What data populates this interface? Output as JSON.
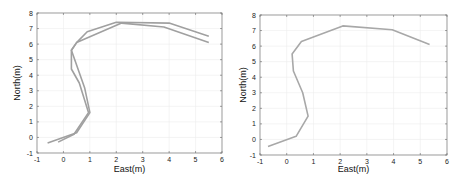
{
  "chart_data": [
    {
      "type": "line",
      "title": "",
      "xlabel": "East(m)",
      "ylabel": "North(m)",
      "xlim": [
        -1,
        6
      ],
      "ylim": [
        -1,
        8
      ],
      "xticks": [
        "-1",
        "0",
        "1",
        "2",
        "3",
        "4",
        "5",
        "6"
      ],
      "yticks": [
        "-1",
        "0",
        "1",
        "2",
        "3",
        "4",
        "5",
        "6",
        "7",
        "8"
      ],
      "grid": true,
      "legend": null,
      "series": [
        {
          "name": "trajectory-1",
          "color": "#a0a0a0",
          "x": [
            -0.6,
            0.5,
            1.0,
            0.8,
            0.3,
            0.5,
            0.9,
            2.0,
            4.0,
            5.5
          ],
          "y": [
            -0.35,
            0.3,
            1.6,
            3.2,
            5.6,
            6.1,
            6.8,
            7.4,
            7.35,
            6.5
          ]
        },
        {
          "name": "trajectory-2",
          "color": "#a0a0a0",
          "x": [
            -0.2,
            0.4,
            0.95,
            0.6,
            0.3,
            0.3,
            0.5,
            2.2,
            3.8,
            5.5
          ],
          "y": [
            -0.3,
            0.2,
            1.6,
            3.5,
            4.4,
            5.6,
            6.1,
            7.35,
            7.1,
            6.1
          ]
        }
      ]
    },
    {
      "type": "line",
      "title": "",
      "xlabel": "East(m)",
      "ylabel": "North(m)",
      "xlim": [
        -1,
        6
      ],
      "ylim": [
        -1,
        8
      ],
      "xticks": [
        "-1",
        "0",
        "1",
        "2",
        "3",
        "4",
        "5",
        "6"
      ],
      "yticks": [
        "-1",
        "0",
        "1",
        "2",
        "3",
        "4",
        "5",
        "6",
        "7",
        "8"
      ],
      "grid": true,
      "legend": null,
      "series": [
        {
          "name": "trajectory",
          "color": "#a8a8a8",
          "x": [
            -0.7,
            0.35,
            0.8,
            0.6,
            0.25,
            0.2,
            0.55,
            2.1,
            3.95,
            5.35
          ],
          "y": [
            -0.45,
            0.2,
            1.5,
            3.0,
            4.4,
            5.5,
            6.3,
            7.3,
            7.05,
            6.1
          ]
        }
      ]
    }
  ],
  "plots": [
    {
      "box": {
        "left": 37,
        "right": 222,
        "top": 13,
        "bottom": 153
      },
      "xlabel_y": 172,
      "ylabel_x": 12
    },
    {
      "box": {
        "left": 30,
        "right": 217,
        "top": 15,
        "bottom": 155
      },
      "xlabel_y": 172,
      "ylabel_x": 8
    }
  ]
}
